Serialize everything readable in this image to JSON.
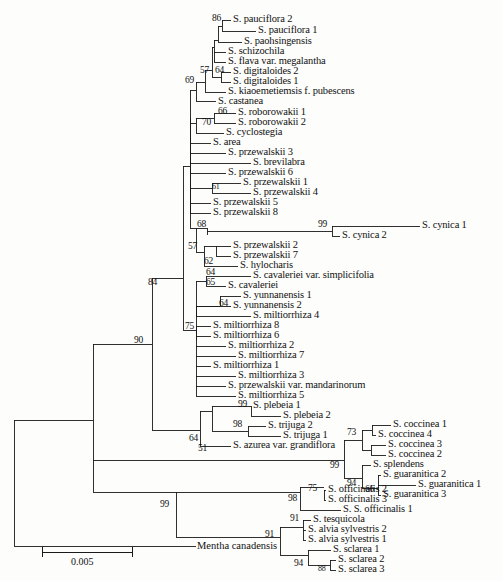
{
  "figure": {
    "type": "phylogenetic-tree",
    "style": "rectangular-cladogram-with-branch-lengths",
    "scale_bar": {
      "label": "0.005",
      "units": "substitutions per site"
    },
    "outgroup": "Mentha canadensis"
  },
  "taxa": [
    {
      "id": "t1",
      "label": "S. pauciflora 2",
      "x": 233,
      "y": 20
    },
    {
      "id": "t2",
      "label": "S. pauciflora 1",
      "x": 258,
      "y": 31
    },
    {
      "id": "t3",
      "label": "S. paohsingensis",
      "x": 244,
      "y": 42
    },
    {
      "id": "t4",
      "label": "S. schizochila",
      "x": 228,
      "y": 52
    },
    {
      "id": "t5",
      "label": "S. flava var. megalantha",
      "x": 228,
      "y": 62
    },
    {
      "id": "t6",
      "label": "S. digitaloides 2",
      "x": 233,
      "y": 72
    },
    {
      "id": "t7",
      "label": "S. digitaloides 1",
      "x": 233,
      "y": 82
    },
    {
      "id": "t8",
      "label": "S. kiaoemetiemsis f. pubescens",
      "x": 228,
      "y": 92
    },
    {
      "id": "t9",
      "label": "S. castanea",
      "x": 218,
      "y": 102
    },
    {
      "id": "t10",
      "label": "S. roborowakii 1",
      "x": 238,
      "y": 113
    },
    {
      "id": "t11",
      "label": "S. roborowakii 2",
      "x": 238,
      "y": 123
    },
    {
      "id": "t12",
      "label": "S. cyclostegia",
      "x": 226,
      "y": 133
    },
    {
      "id": "t13",
      "label": "S. area",
      "x": 213,
      "y": 143
    },
    {
      "id": "t14",
      "label": "S. przewalskii 3",
      "x": 228,
      "y": 153
    },
    {
      "id": "t15",
      "label": "S. brevilabra",
      "x": 253,
      "y": 163
    },
    {
      "id": "t16",
      "label": "S. przewalskii 6",
      "x": 228,
      "y": 173
    },
    {
      "id": "t17",
      "label": "S. przewalskii 1",
      "x": 243,
      "y": 183
    },
    {
      "id": "t18",
      "label": "S. przewalskii 4",
      "x": 253,
      "y": 193
    },
    {
      "id": "t19",
      "label": "S. przewalskii 5",
      "x": 213,
      "y": 203
    },
    {
      "id": "t20",
      "label": "S. przewalskii 8",
      "x": 213,
      "y": 213
    },
    {
      "id": "t21",
      "label": "S. cynica 1",
      "x": 422,
      "y": 226
    },
    {
      "id": "t22",
      "label": "S. cynica 2",
      "x": 342,
      "y": 236
    },
    {
      "id": "t23",
      "label": "S. przewalskii 2",
      "x": 233,
      "y": 246
    },
    {
      "id": "t24",
      "label": "S. przewalskii 7",
      "x": 233,
      "y": 256
    },
    {
      "id": "t25",
      "label": "S. hylocharis",
      "x": 240,
      "y": 266
    },
    {
      "id": "t26",
      "label": "S. cavaleriei var. simplicifolia",
      "x": 253,
      "y": 276
    },
    {
      "id": "t27",
      "label": "S. cavaleriei",
      "x": 228,
      "y": 286
    },
    {
      "id": "t28",
      "label": "S. yunnanensis 1",
      "x": 243,
      "y": 296
    },
    {
      "id": "t29",
      "label": "S. yunnanensis 2",
      "x": 233,
      "y": 306
    },
    {
      "id": "t30",
      "label": "S. miltiorrhiza 4",
      "x": 253,
      "y": 316
    },
    {
      "id": "t31",
      "label": "S. miltiorrhiza 8",
      "x": 213,
      "y": 326
    },
    {
      "id": "t32",
      "label": "S. miltiorrhiza 6",
      "x": 213,
      "y": 336
    },
    {
      "id": "t33",
      "label": "S. miltiorrhiza 2",
      "x": 228,
      "y": 346
    },
    {
      "id": "t34",
      "label": "S. miltiorrhiza 7",
      "x": 238,
      "y": 356
    },
    {
      "id": "t35",
      "label": "S. miltiorrhiza 1",
      "x": 213,
      "y": 366
    },
    {
      "id": "t36",
      "label": "S. miltiorrhiza 3",
      "x": 238,
      "y": 376
    },
    {
      "id": "t37",
      "label": "S. przewalskii var. mandarinorum",
      "x": 228,
      "y": 386
    },
    {
      "id": "t38",
      "label": "S. miltiorrhiza 5",
      "x": 238,
      "y": 396
    },
    {
      "id": "t39",
      "label": "S. plebeia 1",
      "x": 253,
      "y": 406
    },
    {
      "id": "t40",
      "label": "S. plebeia 2",
      "x": 283,
      "y": 416
    },
    {
      "id": "t41",
      "label": "S. trijuga 2",
      "x": 268,
      "y": 426
    },
    {
      "id": "t42",
      "label": "S. trijuga 1",
      "x": 283,
      "y": 436
    },
    {
      "id": "t43",
      "label": "S. azurea var. grandiflora",
      "x": 233,
      "y": 446
    },
    {
      "id": "t44",
      "label": "S. coccinea 1",
      "x": 393,
      "y": 425
    },
    {
      "id": "t45",
      "label": "S. coccinea 4",
      "x": 378,
      "y": 435
    },
    {
      "id": "t46",
      "label": "S. coccinea 3",
      "x": 388,
      "y": 445
    },
    {
      "id": "t47",
      "label": "S. coccinea 2",
      "x": 388,
      "y": 455
    },
    {
      "id": "t48",
      "label": "S. splendens",
      "x": 373,
      "y": 465
    },
    {
      "id": "t49",
      "label": "S. guaranitica 2",
      "x": 383,
      "y": 475
    },
    {
      "id": "t50",
      "label": "S. guaranitica 1",
      "x": 418,
      "y": 485
    },
    {
      "id": "t51",
      "label": "S. guaranitica 3",
      "x": 383,
      "y": 495
    },
    {
      "id": "t52",
      "label": "S. officinalis 2",
      "x": 328,
      "y": 490
    },
    {
      "id": "t53",
      "label": "S. officinalis 3",
      "x": 328,
      "y": 500
    },
    {
      "id": "t54",
      "label": "S. S. officinalis 1",
      "x": 343,
      "y": 510
    },
    {
      "id": "t55",
      "label": "S. tesquicola",
      "x": 313,
      "y": 520
    },
    {
      "id": "t56",
      "label": "S. alvia sylvestris 2",
      "x": 308,
      "y": 530
    },
    {
      "id": "t57",
      "label": "S. alvia sylvestris 1",
      "x": 308,
      "y": 540
    },
    {
      "id": "t58",
      "label": "S. sclarea 1",
      "x": 333,
      "y": 550
    },
    {
      "id": "t59",
      "label": "S. sclarea 2",
      "x": 338,
      "y": 560
    },
    {
      "id": "t60",
      "label": "S. sclarea 3",
      "x": 338,
      "y": 570
    },
    {
      "id": "t61",
      "label": "Mentha canadensis",
      "x": 197,
      "y": 546
    }
  ],
  "bootstrap_values": [
    {
      "id": "b86",
      "value": "86",
      "x": 212,
      "y": 14,
      "size": "normal"
    },
    {
      "id": "b57",
      "value": "57",
      "x": 200,
      "y": 66,
      "size": "normal"
    },
    {
      "id": "b64",
      "value": "64",
      "x": 215,
      "y": 66,
      "size": "normal"
    },
    {
      "id": "b69",
      "value": "69",
      "x": 185,
      "y": 76,
      "size": "normal"
    },
    {
      "id": "b66",
      "value": "66",
      "x": 218,
      "y": 107,
      "size": "normal"
    },
    {
      "id": "b70",
      "value": "70",
      "x": 202,
      "y": 118,
      "size": "normal"
    },
    {
      "id": "b61",
      "value": "61",
      "x": 212,
      "y": 190,
      "size": "small"
    },
    {
      "id": "b68",
      "value": "68",
      "x": 197,
      "y": 220,
      "size": "normal"
    },
    {
      "id": "b99a",
      "value": "99",
      "x": 333,
      "y": 220,
      "size": "normal"
    },
    {
      "id": "b57b",
      "value": "57",
      "x": 194,
      "y": 243,
      "size": "normal"
    },
    {
      "id": "b62",
      "value": "62",
      "x": 208,
      "y": 260,
      "size": "normal"
    },
    {
      "id": "b64b",
      "value": "64",
      "x": 210,
      "y": 271,
      "size": "normal"
    },
    {
      "id": "b65",
      "value": "65",
      "x": 208,
      "y": 281,
      "size": "normal"
    },
    {
      "id": "b64c",
      "value": "64",
      "x": 222,
      "y": 302,
      "size": "normal"
    },
    {
      "id": "b84",
      "value": "84",
      "x": 148,
      "y": 261,
      "size": "normal"
    },
    {
      "id": "b75",
      "value": "75",
      "x": 200,
      "y": 322,
      "size": "normal"
    },
    {
      "id": "b99b",
      "value": "99",
      "x": 232,
      "y": 400,
      "size": "normal"
    },
    {
      "id": "b98",
      "value": "98",
      "x": 248,
      "y": 421,
      "size": "normal"
    },
    {
      "id": "b64d",
      "value": "64",
      "x": 194,
      "y": 441,
      "size": "normal"
    },
    {
      "id": "b51",
      "value": "51",
      "x": 201,
      "y": 452,
      "size": "normal"
    },
    {
      "id": "b90",
      "value": "90",
      "x": 134,
      "y": 344,
      "size": "normal"
    },
    {
      "id": "b73",
      "value": "73",
      "x": 348,
      "y": 432,
      "size": "normal"
    },
    {
      "id": "b99c",
      "value": "99",
      "x": 327,
      "y": 463,
      "size": "normal"
    },
    {
      "id": "b94",
      "value": "94",
      "x": 348,
      "y": 479,
      "size": "normal"
    },
    {
      "id": "b66b",
      "value": "66",
      "x": 366,
      "y": 486,
      "size": "normal"
    },
    {
      "id": "b75b",
      "value": "75",
      "x": 307,
      "y": 485,
      "size": "normal"
    },
    {
      "id": "b98b",
      "value": "98",
      "x": 292,
      "y": 496,
      "size": "normal"
    },
    {
      "id": "b91a",
      "value": "91",
      "x": 293,
      "y": 515,
      "size": "normal"
    },
    {
      "id": "b99d",
      "value": "99",
      "x": 232,
      "y": 500,
      "size": "normal"
    },
    {
      "id": "b91b",
      "value": "91",
      "x": 269,
      "y": 537,
      "size": "normal"
    },
    {
      "id": "b94b",
      "value": "94",
      "x": 298,
      "y": 562,
      "size": "normal"
    },
    {
      "id": "b88",
      "value": "88",
      "x": 322,
      "y": 566,
      "size": "small"
    }
  ],
  "scale": {
    "label": "0.005",
    "label_x": 72,
    "label_y": 562,
    "bar_x1": 42,
    "bar_x2": 132,
    "bar_y": 552
  }
}
